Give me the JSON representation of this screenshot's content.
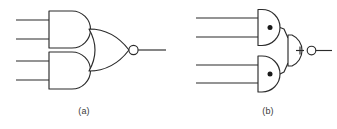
{
  "figure": {
    "type": "logic-gate-diagram",
    "background_color": "#ffffff",
    "line_color": "#2b2b2b"
  },
  "panels": [
    {
      "id": "a",
      "label": "(a)",
      "symbol_style": "distinctive-shape",
      "gates": [
        {
          "name": "and-gate-top",
          "type": "AND",
          "operator_symbol": "",
          "inputs": 2,
          "inverted_output": false
        },
        {
          "name": "and-gate-bottom",
          "type": "AND",
          "operator_symbol": "",
          "inputs": 2,
          "inverted_output": false
        },
        {
          "name": "nor-gate-output",
          "type": "NOR",
          "operator_symbol": "",
          "inputs": 2,
          "inverted_output": true
        }
      ]
    },
    {
      "id": "b",
      "label": "(b)",
      "symbol_style": "operator-marked",
      "gates": [
        {
          "name": "and-gate-top",
          "type": "AND",
          "operator_symbol": "·",
          "inputs": 2,
          "inverted_output": false
        },
        {
          "name": "and-gate-bottom",
          "type": "AND",
          "operator_symbol": "·",
          "inputs": 2,
          "inverted_output": false
        },
        {
          "name": "nor-gate-output",
          "type": "NOR",
          "operator_symbol": "+",
          "inputs": 2,
          "inverted_output": true
        }
      ]
    }
  ]
}
